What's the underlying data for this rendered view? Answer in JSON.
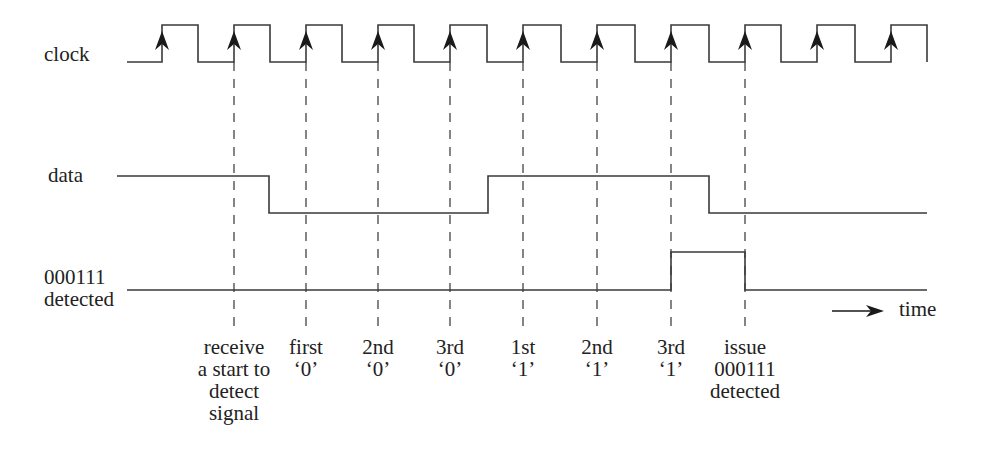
{
  "diagram": {
    "type": "timing-diagram",
    "colors": {
      "line": "#3a3a3a",
      "arrow": "#1a1a1a",
      "dash": "#444444",
      "text": "#222222"
    },
    "signals": [
      {
        "id": "clock",
        "label": "clock",
        "high_y": 25,
        "low_y": 62,
        "rising_edges_x": [
          162,
          234,
          306,
          378,
          450,
          523,
          597,
          671,
          745,
          817,
          891
        ],
        "falling_edges_x": [
          198,
          270,
          342,
          414,
          487,
          561,
          635,
          709,
          781,
          855
        ],
        "start_x": 127,
        "end_x": 927,
        "edge_markers": "up-arrow"
      },
      {
        "id": "data",
        "label": "data",
        "high_y": 176,
        "low_y": 213,
        "start_x": 117,
        "end_x": 927,
        "initial": "high",
        "transitions_x": [
          269,
          488,
          709
        ]
      },
      {
        "id": "detected",
        "label_lines": [
          "000111",
          "detected"
        ],
        "high_y": 252,
        "low_y": 290,
        "start_x": 127,
        "end_x": 927,
        "initial": "low",
        "transitions_x": [
          671,
          745
        ]
      }
    ],
    "markers": [
      {
        "x": 234,
        "lines": [
          "receive",
          "a start to",
          "detect",
          "signal"
        ]
      },
      {
        "x": 306,
        "lines": [
          "first",
          "‘0’"
        ]
      },
      {
        "x": 378,
        "lines": [
          "2nd",
          "‘0’"
        ]
      },
      {
        "x": 450,
        "lines": [
          "3rd",
          "‘0’"
        ]
      },
      {
        "x": 523,
        "lines": [
          "1st",
          "‘1’"
        ]
      },
      {
        "x": 597,
        "lines": [
          "2nd",
          "‘1’"
        ]
      },
      {
        "x": 671,
        "lines": [
          "3rd",
          "‘1’"
        ]
      },
      {
        "x": 745,
        "lines": [
          "issue",
          "000111",
          "detected"
        ]
      }
    ],
    "time_axis": {
      "label": "time",
      "arrow_from_x": 832,
      "arrow_to_x": 884,
      "y": 311
    }
  },
  "labels": {
    "clock": "clock",
    "data": "data",
    "detected_line1": "000111",
    "detected_line2": "detected",
    "time": "time"
  }
}
